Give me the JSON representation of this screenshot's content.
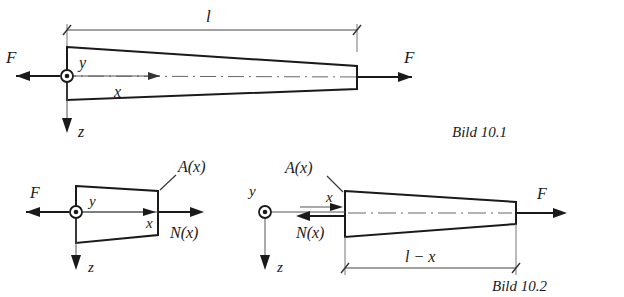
{
  "figure": {
    "domain": "technical-engineering-diagram",
    "background_color": "#ffffff",
    "line_color": "#1a1a1a"
  },
  "figure1": {
    "caption": "Bild 10.1",
    "labels": {
      "length": "l",
      "force_left": "F",
      "force_right": "F",
      "axis_x": "x",
      "axis_y": "y",
      "axis_z": "z"
    }
  },
  "figure2": {
    "caption": "Bild 10.2",
    "left_part": {
      "labels": {
        "force": "F",
        "area": "A(x)",
        "normal_force": "N(x)",
        "axis_x": "x",
        "axis_y": "y",
        "axis_z": "z"
      }
    },
    "right_part": {
      "labels": {
        "force": "F",
        "area": "A(x)",
        "normal_force": "N(x)",
        "length": "l − x",
        "axis_x": "x",
        "axis_y": "y",
        "axis_z": "z"
      }
    }
  }
}
